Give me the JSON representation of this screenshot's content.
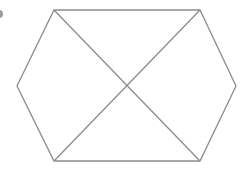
{
  "diagram": {
    "background": "#ffffff",
    "stroke_color": "#8c8c8c",
    "stroke_width": 1.3,
    "hexagon": {
      "vertices": [
        [
          54,
          10
        ],
        [
          200,
          10
        ],
        [
          236,
          86
        ],
        [
          200,
          161
        ],
        [
          54,
          161
        ],
        [
          17,
          86
        ]
      ]
    },
    "diagonals": [
      {
        "from": [
          54,
          10
        ],
        "to": [
          200,
          161
        ]
      },
      {
        "from": [
          200,
          10
        ],
        "to": [
          54,
          161
        ]
      }
    ],
    "intersection": [
      127,
      86
    ],
    "edge_mark": {
      "cx": -1,
      "cy": 14,
      "r": 4,
      "color": "#9a9a9a"
    }
  }
}
